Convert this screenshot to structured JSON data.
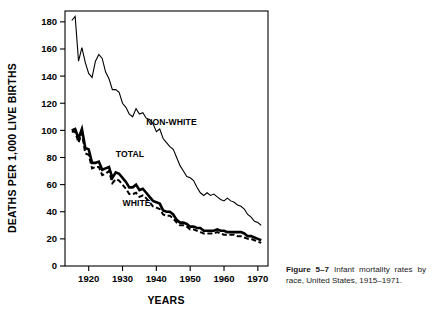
{
  "figure": {
    "caption_label": "Figure 5–7",
    "caption_text": "Infant mortality rates by race, United States, 1915–1971."
  },
  "chart_data": {
    "type": "line",
    "title": "",
    "xlabel": "YEARS",
    "ylabel": "DEATHS PER 1,000 LIVE BIRTHS",
    "xlim": [
      1913,
      1973
    ],
    "ylim": [
      0,
      188
    ],
    "yticks": [
      0,
      20,
      40,
      60,
      80,
      100,
      120,
      140,
      160,
      180
    ],
    "xticks": [
      1920,
      1930,
      1940,
      1950,
      1960,
      1970
    ],
    "grid": false,
    "legend": "inline-labels",
    "series": [
      {
        "name": "NON-WHITE",
        "style": "thin-solid",
        "label_x": 1937,
        "label_y": 104,
        "x": [
          1915,
          1916,
          1917,
          1918,
          1919,
          1920,
          1921,
          1922,
          1923,
          1924,
          1925,
          1926,
          1927,
          1928,
          1929,
          1930,
          1931,
          1932,
          1933,
          1934,
          1935,
          1936,
          1937,
          1938,
          1939,
          1940,
          1941,
          1942,
          1943,
          1944,
          1945,
          1946,
          1947,
          1948,
          1949,
          1950,
          1951,
          1952,
          1953,
          1954,
          1955,
          1956,
          1957,
          1958,
          1959,
          1960,
          1961,
          1962,
          1963,
          1964,
          1965,
          1966,
          1967,
          1968,
          1969,
          1970,
          1971
        ],
        "y": [
          181,
          184,
          151,
          161,
          150,
          142,
          139,
          151,
          156,
          153,
          143,
          138,
          130,
          130,
          128,
          120,
          117,
          112,
          110,
          116,
          112,
          113,
          109,
          108,
          105,
          99,
          101,
          94,
          91,
          88,
          86,
          80,
          74,
          70,
          66,
          65,
          63,
          58,
          54,
          52,
          54,
          52,
          53,
          51,
          49,
          48,
          50,
          48,
          47,
          45,
          44,
          42,
          38,
          36,
          33,
          32,
          30
        ]
      },
      {
        "name": "TOTAL",
        "style": "thick-solid",
        "label_x": 1928,
        "label_y": 80,
        "x": [
          1915,
          1916,
          1917,
          1918,
          1919,
          1920,
          1921,
          1922,
          1923,
          1924,
          1925,
          1926,
          1927,
          1928,
          1929,
          1930,
          1931,
          1932,
          1933,
          1934,
          1935,
          1936,
          1937,
          1938,
          1939,
          1940,
          1941,
          1942,
          1943,
          1944,
          1945,
          1946,
          1947,
          1948,
          1949,
          1950,
          1951,
          1952,
          1953,
          1954,
          1955,
          1956,
          1957,
          1958,
          1959,
          1960,
          1961,
          1962,
          1963,
          1964,
          1965,
          1966,
          1967,
          1968,
          1969,
          1970,
          1971
        ],
        "y": [
          100,
          101,
          94,
          101,
          87,
          86,
          76,
          76,
          77,
          71,
          72,
          73,
          65,
          69,
          68,
          65,
          62,
          58,
          58,
          60,
          56,
          57,
          54,
          51,
          48,
          47,
          46,
          41,
          40,
          40,
          38,
          34,
          32,
          32,
          31,
          29,
          29,
          28,
          28,
          26,
          26,
          26,
          26,
          27,
          26,
          26,
          25,
          25,
          25,
          25,
          25,
          24,
          22,
          22,
          21,
          20,
          19
        ]
      },
      {
        "name": "WHITE",
        "style": "dashed",
        "label_x": 1930,
        "label_y": 44,
        "x": [
          1915,
          1916,
          1917,
          1918,
          1919,
          1920,
          1921,
          1922,
          1923,
          1924,
          1925,
          1926,
          1927,
          1928,
          1929,
          1930,
          1931,
          1932,
          1933,
          1934,
          1935,
          1936,
          1937,
          1938,
          1939,
          1940,
          1941,
          1942,
          1943,
          1944,
          1945,
          1946,
          1947,
          1948,
          1949,
          1950,
          1951,
          1952,
          1953,
          1954,
          1955,
          1956,
          1957,
          1958,
          1959,
          1960,
          1961,
          1962,
          1963,
          1964,
          1965,
          1966,
          1967,
          1968,
          1969,
          1970,
          1971
        ],
        "y": [
          99,
          99,
          91,
          98,
          83,
          82,
          72,
          73,
          73,
          67,
          68,
          70,
          61,
          64,
          63,
          60,
          57,
          53,
          53,
          54,
          51,
          52,
          50,
          47,
          44,
          43,
          42,
          38,
          37,
          37,
          35,
          32,
          30,
          30,
          29,
          27,
          27,
          26,
          25,
          24,
          24,
          24,
          24,
          25,
          24,
          23,
          23,
          23,
          23,
          22,
          22,
          21,
          20,
          20,
          19,
          18,
          17
        ]
      }
    ]
  }
}
